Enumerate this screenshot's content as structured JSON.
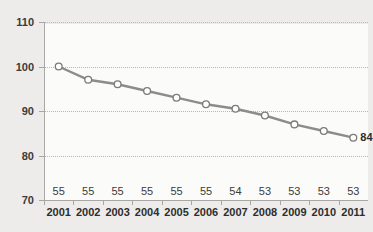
{
  "chart_data": {
    "type": "line",
    "title": "",
    "xlabel": "",
    "ylabel": "",
    "ylim": [
      70,
      110
    ],
    "yticks": [
      70,
      80,
      90,
      100,
      110
    ],
    "grid": true,
    "legend": false,
    "categories": [
      "2001",
      "2002",
      "2003",
      "2004",
      "2005",
      "2006",
      "2007",
      "2008",
      "2009",
      "2010",
      "2011"
    ],
    "series": [
      {
        "name": "index",
        "values": [
          100,
          97,
          96,
          94.5,
          93,
          91.5,
          90.5,
          89,
          87,
          85.5,
          84
        ],
        "marker": "circle-open",
        "line_color": "#8c8c8c",
        "marker_fill": "#ffffff",
        "marker_edge": "#7a7a7a"
      }
    ],
    "data_labels": {
      "last_point": "84"
    },
    "secondary_row": {
      "values": [
        "55",
        "55",
        "55",
        "55",
        "55",
        "55",
        "54",
        "53",
        "53",
        "53",
        "53"
      ]
    },
    "colors": {
      "page_background": "#edecea",
      "panel_background": "#fbfbfa",
      "grid": "#b9b7b3",
      "axis": "#a9a7a3",
      "text": "#2e2e2d"
    }
  },
  "title_fragment": ""
}
